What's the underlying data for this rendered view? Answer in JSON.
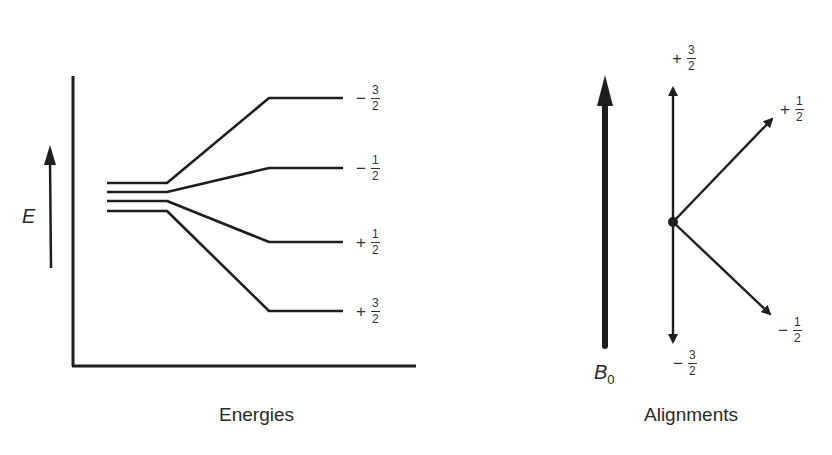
{
  "left_panel": {
    "caption": "Energies",
    "axis_label": "E",
    "levels": [
      {
        "sign": "−",
        "num": "3",
        "den": "2"
      },
      {
        "sign": "−",
        "num": "1",
        "den": "2"
      },
      {
        "sign": "+",
        "num": "1",
        "den": "2"
      },
      {
        "sign": "+",
        "num": "3",
        "den": "2"
      }
    ]
  },
  "right_panel": {
    "caption": "Alignments",
    "field_label": "B",
    "field_subscript": "0",
    "vectors": [
      {
        "id": "up",
        "sign": "+",
        "num": "3",
        "den": "2"
      },
      {
        "id": "upper-right",
        "sign": "+",
        "num": "1",
        "den": "2"
      },
      {
        "id": "lower-right",
        "sign": "−",
        "num": "1",
        "den": "2"
      },
      {
        "id": "down",
        "sign": "−",
        "num": "3",
        "den": "2"
      }
    ]
  },
  "colors": {
    "line": "#1e1e1e",
    "background": "#ffffff"
  }
}
